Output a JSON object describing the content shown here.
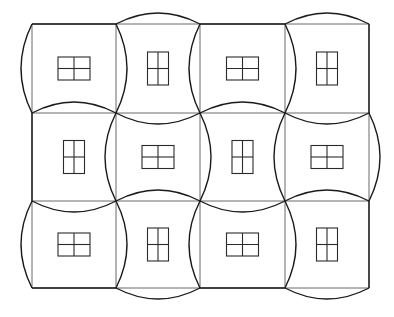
{
  "diagram": {
    "type": "tiled-quilt-pattern",
    "colors": {
      "background": "#ffffff",
      "grid_line": "#6a6a6a",
      "arc": "#1a1a1a",
      "window": "#2a2a2a"
    },
    "grid": {
      "rows": 3,
      "cols": 4,
      "col_x": [
        32,
        116,
        200,
        285,
        369
      ],
      "row_y": [
        24,
        113,
        201,
        288
      ],
      "arc_sagitta": 11
    },
    "tiles": [
      {
        "row": 0,
        "col": 0,
        "type": "A",
        "window": "landscape"
      },
      {
        "row": 0,
        "col": 1,
        "type": "B",
        "window": "portrait"
      },
      {
        "row": 0,
        "col": 2,
        "type": "A",
        "window": "landscape"
      },
      {
        "row": 0,
        "col": 3,
        "type": "B",
        "window": "portrait"
      },
      {
        "row": 1,
        "col": 0,
        "type": "B",
        "window": "portrait"
      },
      {
        "row": 1,
        "col": 1,
        "type": "A",
        "window": "landscape"
      },
      {
        "row": 1,
        "col": 2,
        "type": "B",
        "window": "portrait"
      },
      {
        "row": 1,
        "col": 3,
        "type": "A",
        "window": "landscape"
      },
      {
        "row": 2,
        "col": 0,
        "type": "A",
        "window": "landscape"
      },
      {
        "row": 2,
        "col": 1,
        "type": "B",
        "window": "portrait"
      },
      {
        "row": 2,
        "col": 2,
        "type": "A",
        "window": "landscape"
      },
      {
        "row": 2,
        "col": 3,
        "type": "B",
        "window": "portrait"
      }
    ],
    "window_sizes": {
      "landscape": {
        "w": 32,
        "h": 23
      },
      "portrait": {
        "w": 21,
        "h": 33
      }
    },
    "legend": {
      "A": "left/right edges bulge outward, top/bottom edges bow inward",
      "B": "top/bottom edges bulge outward, left/right edges bow inward"
    }
  }
}
